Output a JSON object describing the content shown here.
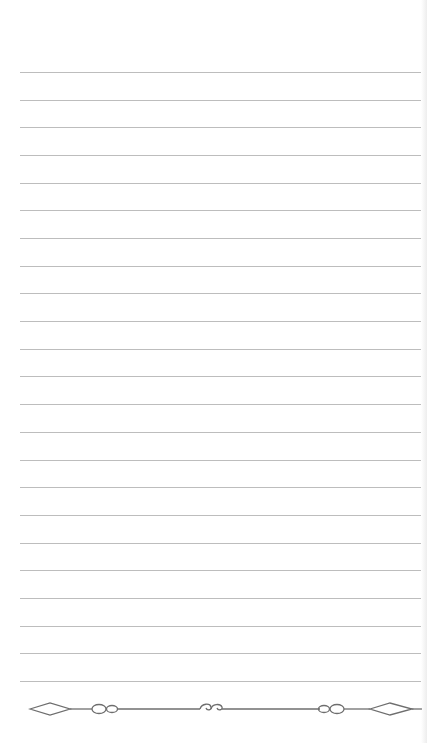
{
  "page": {
    "type": "lined-notebook-page",
    "background_color": "#ffffff",
    "rule_color": "#bdbdbd",
    "ornament_color": "#6e6e6e",
    "rule_count": 23,
    "first_rule_y": 72,
    "rule_spacing": 27.68,
    "ornament": {
      "icon": "decorative-divider-icon",
      "elements": [
        "diamond",
        "double-loop",
        "center-scroll-swirl",
        "double-loop",
        "diamond"
      ]
    }
  }
}
